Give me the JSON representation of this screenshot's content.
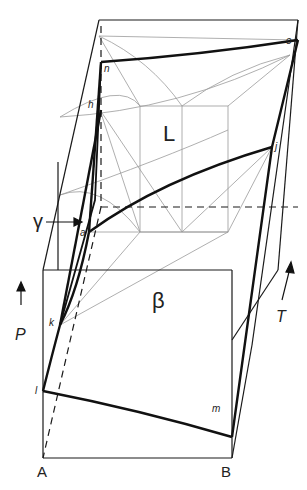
{
  "colors": {
    "line": "#1a1a1a",
    "thin": "#9a9a9a",
    "background": "#ffffff"
  },
  "labels": {
    "phase_L": "L",
    "phase_beta": "β",
    "phase_gamma": "γ",
    "axis_P": "P",
    "axis_T": "T",
    "component_A": "A",
    "component_B": "B",
    "point_n": "n",
    "point_o": "o",
    "point_h": "h",
    "point_j": "j",
    "point_a": "a",
    "point_k": "k",
    "point_l": "l",
    "point_m": "m"
  }
}
